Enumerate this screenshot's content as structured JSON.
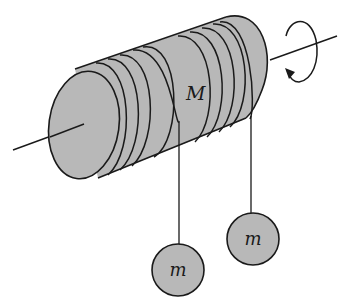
{
  "diagram": {
    "labels": {
      "drum_mass": "M",
      "hanging_mass_left": "m",
      "hanging_mass_right": "m"
    },
    "colors": {
      "fill": "#b8b8b8",
      "stroke": "#1a1a1a",
      "background": "#ffffff"
    },
    "icons": {
      "rotation": "circular-arrow-icon"
    }
  }
}
